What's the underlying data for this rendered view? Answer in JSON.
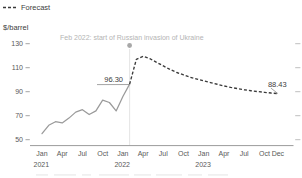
{
  "legend": {
    "items": [
      {
        "label": "Forecast",
        "style": "dashed",
        "color": "#3a3a3a"
      }
    ]
  },
  "axis_unit": "$/barrel",
  "annotation": {
    "text": "Feb 2022: start of Russian invasion of Ukraine",
    "at_month_index": 13,
    "color": "#b4b4b4"
  },
  "value_labels": [
    {
      "name": "peak-history-value",
      "text": "96.30",
      "month_index": 13,
      "value": 96.3
    },
    {
      "name": "forecast-end-value",
      "text": "88.43",
      "month_index": 35,
      "value": 88.43
    }
  ],
  "colors": {
    "history": "#9a9a9a",
    "forecast": "#3a3a3a",
    "axis": "#9b9b9b",
    "annotation": "#b4b4b4"
  },
  "chart_data": {
    "type": "line",
    "title": "",
    "xlabel": "",
    "ylabel": "$/barrel",
    "ylim": [
      50,
      130
    ],
    "yticks": [
      130,
      110,
      90,
      70,
      50
    ],
    "grid": false,
    "legend_position": "top-left",
    "x_tick_months": [
      0,
      3,
      6,
      9,
      12,
      15,
      18,
      21,
      24,
      27,
      30,
      33,
      35
    ],
    "x_tick_labels": [
      "Jan",
      "Apr",
      "Jul",
      "Oct",
      "Jan",
      "Apr",
      "Jul",
      "Oct",
      "Jan",
      "Apr",
      "Jul",
      "Oct",
      "Dec"
    ],
    "year_labels": [
      {
        "text": "2021",
        "month_index": 0
      },
      {
        "text": "2022",
        "month_index": 12
      },
      {
        "text": "2023",
        "month_index": 24
      }
    ],
    "x_start": "Jan 2021",
    "x_end": "Dec 2023",
    "series": [
      {
        "name": "History",
        "style": "solid",
        "x_months": [
          0,
          1,
          2,
          3,
          4,
          5,
          6,
          7,
          8,
          9,
          10,
          11,
          12,
          13
        ],
        "values": [
          55,
          62,
          65,
          64,
          68,
          73,
          75,
          71,
          74,
          83,
          81,
          74,
          86,
          96.3
        ]
      },
      {
        "name": "Forecast",
        "style": "dashed",
        "x_months": [
          13,
          14,
          15,
          16,
          17,
          18,
          19,
          20,
          21,
          22,
          23,
          24,
          25,
          26,
          27,
          28,
          29,
          30,
          31,
          32,
          33,
          34,
          35
        ],
        "values": [
          96.3,
          117.0,
          119.5,
          117.5,
          114.5,
          111.5,
          108.5,
          106.0,
          104.0,
          102.0,
          100.5,
          99.0,
          97.6,
          96.2,
          94.8,
          93.6,
          92.6,
          91.6,
          90.8,
          90.1,
          89.5,
          88.9,
          88.43
        ]
      }
    ]
  }
}
